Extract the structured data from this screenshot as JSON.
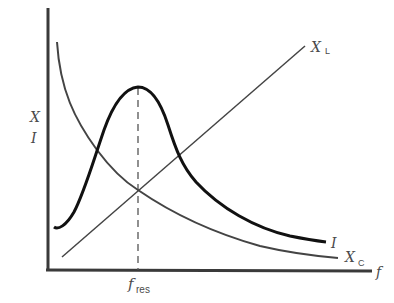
{
  "diagram": {
    "axes": {
      "y_label_top": "X",
      "y_label_bottom": "I",
      "x_label": "f",
      "x_tick_label_main": "f",
      "x_tick_label_sub": "res"
    },
    "curves": [
      {
        "id": "XL",
        "label_main": "X",
        "label_sub": "L",
        "description": "inductive reactance, linear increasing"
      },
      {
        "id": "XC",
        "label_main": "X",
        "label_sub": "C",
        "description": "capacitive reactance, hyperbolic decreasing"
      },
      {
        "id": "I",
        "label_main": "I",
        "description": "current, peaked at resonance"
      }
    ],
    "colors": {
      "axis": "#3a3a3a",
      "current": "#111111",
      "reactance": "#444444",
      "dashed": "#555555"
    }
  }
}
